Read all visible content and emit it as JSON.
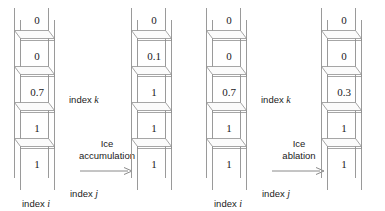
{
  "figure": {
    "type": "ice-column-diagram"
  },
  "columns": [
    {
      "id": "column-1",
      "role": "before-accumulation",
      "cells": [
        "0",
        "0",
        "0.7",
        "1",
        "1"
      ],
      "index_k_label": "index",
      "index_k_symbol": "k",
      "index_j_label": "index",
      "index_j_symbol": "j",
      "index_i_label": "index",
      "index_i_symbol": "i"
    },
    {
      "id": "column-2",
      "role": "after-accumulation",
      "cells": [
        "0",
        "0.1",
        "1",
        "1",
        "1"
      ]
    },
    {
      "id": "column-3",
      "role": "before-ablation",
      "cells": [
        "0",
        "0",
        "0.7",
        "1",
        "1"
      ],
      "index_k_label": "index",
      "index_k_symbol": "k",
      "index_j_label": "index",
      "index_j_symbol": "j",
      "index_i_label": "index",
      "index_i_symbol": "i"
    },
    {
      "id": "column-4",
      "role": "after-ablation",
      "cells": [
        "0",
        "0",
        "0.3",
        "1",
        "1"
      ]
    }
  ],
  "transitions": [
    {
      "id": "accumulation",
      "line1": "Ice",
      "line2": "accumulation"
    },
    {
      "id": "ablation",
      "line1": "Ice",
      "line2": "ablation"
    }
  ],
  "colors": {
    "line": "#9a9a9a",
    "slab_edge": "#7d7d7d",
    "text": "#1a1a1a",
    "background": "#ffffff"
  }
}
